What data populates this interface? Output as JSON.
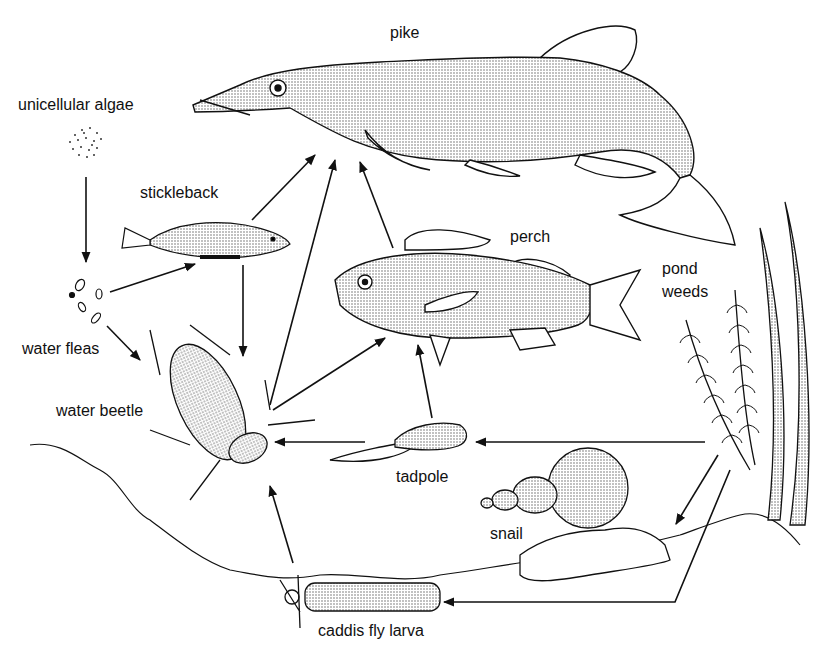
{
  "diagram": {
    "type": "food-web",
    "title": "",
    "organisms": [
      {
        "id": "algae",
        "label": "unicellular algae"
      },
      {
        "id": "fleas",
        "label": "water fleas"
      },
      {
        "id": "stickleback",
        "label": "stickleback"
      },
      {
        "id": "pike",
        "label": "pike"
      },
      {
        "id": "perch",
        "label": "perch"
      },
      {
        "id": "beetle",
        "label": "water beetle"
      },
      {
        "id": "tadpole",
        "label": "tadpole"
      },
      {
        "id": "snail",
        "label": "snail"
      },
      {
        "id": "caddis",
        "label": "caddis fly larva"
      },
      {
        "id": "weeds",
        "label_line1": "pond",
        "label_line2": "weeds"
      }
    ],
    "arrows": [
      {
        "from": "unicellular algae",
        "to": "water fleas"
      },
      {
        "from": "water fleas",
        "to": "stickleback"
      },
      {
        "from": "water fleas",
        "to": "water beetle"
      },
      {
        "from": "stickleback",
        "to": "pike"
      },
      {
        "from": "stickleback",
        "to": "water beetle"
      },
      {
        "from": "water beetle",
        "to": "pike"
      },
      {
        "from": "water beetle",
        "to": "perch"
      },
      {
        "from": "perch",
        "to": "pike"
      },
      {
        "from": "tadpole",
        "to": "perch"
      },
      {
        "from": "tadpole",
        "to": "water beetle"
      },
      {
        "from": "pond weeds",
        "to": "tadpole"
      },
      {
        "from": "pond weeds",
        "to": "snail"
      },
      {
        "from": "pond weeds",
        "to": "caddis fly larva"
      },
      {
        "from": "caddis fly larva",
        "to": "water beetle"
      }
    ]
  }
}
